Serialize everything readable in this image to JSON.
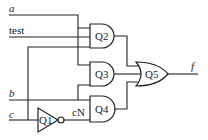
{
  "diagram": {
    "type": "logic-circuit",
    "inputs": [
      {
        "id": "a",
        "label": "a"
      },
      {
        "id": "test",
        "label": "test"
      },
      {
        "id": "b",
        "label": "b"
      },
      {
        "id": "c",
        "label": "c"
      }
    ],
    "output": {
      "id": "f",
      "label": "f"
    },
    "internal_signals": [
      {
        "id": "cN",
        "label": "cN"
      }
    ],
    "gates": [
      {
        "id": "Q1",
        "label": "Q1",
        "type": "NOT",
        "inputs": [
          "c"
        ],
        "output": "cN"
      },
      {
        "id": "Q2",
        "label": "Q2",
        "type": "AND",
        "inputs": [
          "a",
          "test"
        ],
        "output": "Q2"
      },
      {
        "id": "Q3",
        "label": "Q3",
        "type": "AND",
        "inputs": [
          "a",
          "c"
        ],
        "output": "Q3"
      },
      {
        "id": "Q4",
        "label": "Q4",
        "type": "AND",
        "inputs": [
          "b",
          "cN"
        ],
        "output": "Q4"
      },
      {
        "id": "Q5",
        "label": "Q5",
        "type": "OR",
        "inputs": [
          "Q2",
          "Q3",
          "Q4"
        ],
        "output": "f"
      }
    ]
  }
}
